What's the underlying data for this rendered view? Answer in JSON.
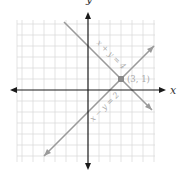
{
  "figure": {
    "type": "graph",
    "axes": {
      "x_label": "x",
      "y_label": "y"
    },
    "grid": {
      "x_min": -6.5,
      "x_max": 6,
      "y_min": -6.5,
      "y_max": 6.5,
      "step": 1
    },
    "lines": [
      {
        "equation": "x + y = 4",
        "label": "x + y = 4",
        "color": "#9a9a9a"
      },
      {
        "equation": "x − y = 2",
        "label": "x − y = 2",
        "color": "#9a9a9a"
      }
    ],
    "intersection": {
      "label": "(3, 1)",
      "x": 3,
      "y": 1
    },
    "colors": {
      "grid": "#d9d9d9",
      "axis": "#1a1a1a",
      "line": "#9a9a9a",
      "label": "#a8a8a8"
    }
  }
}
